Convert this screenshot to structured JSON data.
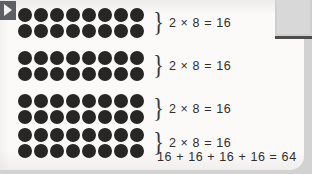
{
  "page": {
    "background_color": "#d2d2d2",
    "paper_color": "#fbfaf8",
    "dot_color": "#262626",
    "text_color": "#2e2e2e"
  },
  "markers": {
    "arrow_icon_name": "right-arrow-marker",
    "corner_panel_name": "gray-corner-panel",
    "corner_panel_color": "#cfcfcf",
    "corner_panel_border_color": "#4d4d4d"
  },
  "array_model": {
    "rows_per_group": 2,
    "dots_per_row": 8,
    "group_count": 4,
    "dots_per_group": 16,
    "total_dots": 64
  },
  "groups": [
    {
      "equation": "2 × 8 = 16",
      "brace": "}",
      "factor_a": 2,
      "factor_b": 8,
      "product": 16
    },
    {
      "equation": "2 × 8 = 16",
      "brace": "}",
      "factor_a": 2,
      "factor_b": 8,
      "product": 16
    },
    {
      "equation": "2 × 8 = 16",
      "brace": "}",
      "factor_a": 2,
      "factor_b": 8,
      "product": 16
    },
    {
      "equation": "2 × 8 = 16",
      "brace": "}",
      "factor_a": 2,
      "factor_b": 8,
      "product": 16
    }
  ],
  "summary": {
    "sum_expression": "16 + 16 + 16 + 16 = 64",
    "addends": [
      16,
      16,
      16,
      16
    ],
    "total": 64
  }
}
